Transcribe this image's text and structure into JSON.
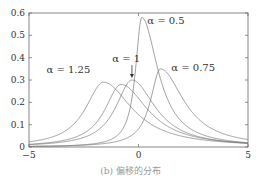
{
  "chart_data": {
    "type": "line",
    "title": "",
    "caption": "(b) 偏移的分布",
    "xlabel": "",
    "ylabel": "",
    "xlim": [
      -5,
      5
    ],
    "ylim": [
      0,
      0.6
    ],
    "xticks": [
      -5,
      0,
      5
    ],
    "yticks": [
      0,
      0.1,
      0.2,
      0.3,
      0.4,
      0.5,
      0.6
    ],
    "grid": false,
    "series": [
      {
        "name": "α = 0.5",
        "peak_x": 0.15,
        "peak_y": 0.58,
        "left_width": 0.35,
        "right_width": 0.9
      },
      {
        "name": "α = 0.75",
        "peak_x": 1.0,
        "peak_y": 0.35,
        "left_width": 0.55,
        "right_width": 1.3
      },
      {
        "name": "α = 1",
        "peak_x": -0.3,
        "peak_y": 0.3,
        "left_width": 0.9,
        "right_width": 1.3
      },
      {
        "name": "α = 1.25",
        "peak_x": -1.6,
        "peak_y": 0.29,
        "left_width": 1.0,
        "right_width": 1.6
      },
      {
        "name": "unlabeled",
        "peak_x": -0.8,
        "peak_y": 0.28,
        "left_width": 0.9,
        "right_width": 1.5
      }
    ],
    "annotations": [
      {
        "text": "α = 0.5",
        "x": 0.4,
        "y": 0.55
      },
      {
        "text": "α = 0.75",
        "x": 1.5,
        "y": 0.34
      },
      {
        "text": "α = 1",
        "x": -1.2,
        "y": 0.38,
        "arrow_to": [
          -0.3,
          0.305
        ]
      },
      {
        "text": "α = 1.25",
        "x": -4.2,
        "y": 0.33
      }
    ]
  }
}
